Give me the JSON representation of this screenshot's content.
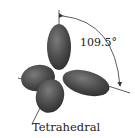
{
  "figure": {
    "caption": "Tetrahedral",
    "angle_label": "109.5°",
    "top_cutoff_text": "·",
    "colors": {
      "lobe_fill": "#4a4a4a",
      "lobe_highlight": "#7a7a7a",
      "axis_line": "#333333",
      "text": "#222222"
    },
    "lobes": [
      {
        "name": "top",
        "direction": "up"
      },
      {
        "name": "left",
        "direction": "left"
      },
      {
        "name": "right",
        "direction": "right-down"
      },
      {
        "name": "bottom",
        "direction": "down-left"
      }
    ]
  }
}
